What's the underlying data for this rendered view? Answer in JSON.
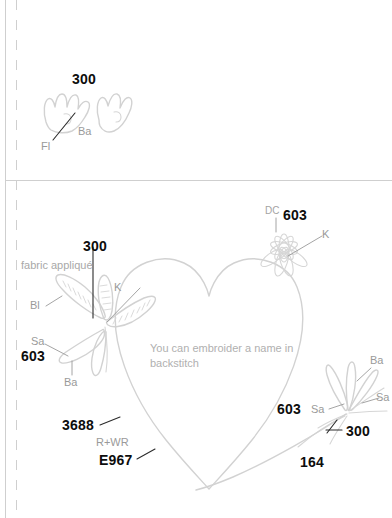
{
  "page": {
    "width": 392,
    "height": 518,
    "background": "#ffffff",
    "stitch_line_color": "#cccccc",
    "leader_line_color": "#333333",
    "gray_label_color": "#9a9a9a",
    "bold_label_color": "#0d0d0d"
  },
  "top_panel": {
    "thread_code": "300",
    "motif_name": "paired-leaf-motif",
    "labels": [
      {
        "text": "Fl",
        "name": "label-fl"
      },
      {
        "text": "Ba",
        "name": "label-ba"
      }
    ]
  },
  "divider": {
    "name": "panel-divider",
    "color": "#d8d8d8"
  },
  "margin": {
    "solid_rule_color": "#cfcfcf",
    "dashed_rule_color": "#cfcfcf",
    "dash_pattern": "10 10"
  },
  "main_panel": {
    "center_note": "You can embroider a name in backstitch",
    "appliqué_note": "fabric appliqué",
    "heart": {
      "name": "heart-outline",
      "color": "#d2d2d2"
    },
    "left_flower": {
      "name": "left-leaf-spray",
      "thread_code": "300",
      "labels": [
        {
          "text": "K",
          "name": "label-k-left"
        },
        {
          "text": "Bl",
          "name": "label-bl"
        },
        {
          "text": "Sa",
          "name": "label-sa-left"
        },
        {
          "text": "603",
          "name": "label-603-left"
        },
        {
          "text": "Ba",
          "name": "label-ba-left"
        }
      ]
    },
    "top_daisy": {
      "name": "daisy-flower",
      "thread_code": "603",
      "labels": [
        {
          "text": "DC",
          "name": "label-dc"
        },
        {
          "text": "K",
          "name": "label-k-daisy"
        }
      ]
    },
    "right_spray": {
      "name": "right-leaf-spray",
      "labels": [
        {
          "text": "Ba",
          "name": "label-ba-right"
        },
        {
          "text": "Sa",
          "name": "label-sa-right-outer"
        },
        {
          "text": "Sa",
          "name": "label-sa-right-inner"
        },
        {
          "text": "603",
          "name": "label-603-right"
        },
        {
          "text": "300",
          "name": "label-300-right"
        },
        {
          "text": "164",
          "name": "label-164"
        }
      ]
    },
    "heart_outline_labels": [
      {
        "text": "3688",
        "name": "label-3688"
      },
      {
        "text": "R+WR",
        "name": "label-rwr"
      },
      {
        "text": "E967",
        "name": "label-e967"
      }
    ]
  }
}
